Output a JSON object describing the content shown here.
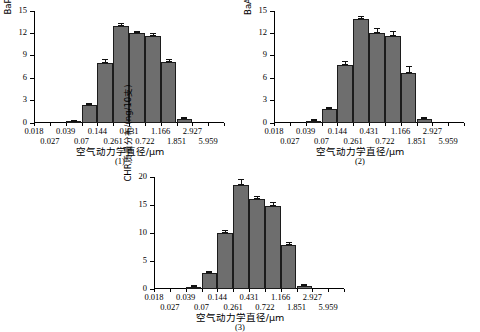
{
  "figure": {
    "background": "#ffffff",
    "bar_color": "#6e6e6e",
    "bar_edge_color": "#1c1c1c",
    "axis_color": "#000000"
  },
  "shared": {
    "xlabel": "空气动力学直径/μm",
    "xtick_labels_row1": [
      "0.018",
      "0.039",
      "0.144",
      "0.431",
      "1.166",
      "2.927"
    ],
    "xtick_labels_row2": [
      "0.027",
      "0.07",
      "0.261",
      "0.722",
      "1.851",
      "5.959"
    ]
  },
  "panels": [
    {
      "tag": "(1)",
      "ylabel": "BaP质量分布/(ng/10支)",
      "chart_data": {
        "type": "bar",
        "title": "",
        "xlabel": "空气动力学直径/μm",
        "ylabel": "BaP质量分布/(ng/10支)",
        "categories": [
          "0.018",
          "0.027",
          "0.039",
          "0.07",
          "0.144",
          "0.261",
          "0.431",
          "0.722",
          "1.166",
          "1.851",
          "2.927",
          "5.959"
        ],
        "values": [
          0,
          0,
          0.15,
          2.35,
          8.1,
          13.0,
          12.0,
          11.6,
          8.2,
          0.5,
          0,
          0
        ],
        "errors": [
          0,
          0,
          0.08,
          0.18,
          0.35,
          0.3,
          0.25,
          0.3,
          0.3,
          0.2,
          0,
          0
        ],
        "ylim": [
          0,
          15
        ],
        "yticks": [
          0,
          3,
          6,
          9,
          12,
          15
        ],
        "ytick_labels": [
          "0",
          "3",
          "6",
          "9",
          "12",
          "15"
        ],
        "grid": false,
        "legend": "none"
      }
    },
    {
      "tag": "(2)",
      "ylabel": "BaA质量分布/(ng/10支)",
      "chart_data": {
        "type": "bar",
        "title": "",
        "xlabel": "空气动力学直径/μm",
        "ylabel": "BaA质量分布/(ng/10支)",
        "categories": [
          "0.018",
          "0.027",
          "0.039",
          "0.07",
          "0.144",
          "0.261",
          "0.431",
          "0.722",
          "1.166",
          "1.851",
          "2.927",
          "5.959"
        ],
        "values": [
          0,
          0,
          0.3,
          1.85,
          7.75,
          13.9,
          12.1,
          11.6,
          6.7,
          0.5,
          0,
          0
        ],
        "errors": [
          0,
          0,
          0.1,
          0.12,
          0.4,
          0.35,
          0.55,
          0.6,
          0.8,
          0.18,
          0,
          0
        ],
        "ylim": [
          0,
          15
        ],
        "yticks": [
          0,
          3,
          6,
          9,
          12,
          15
        ],
        "ytick_labels": [
          "0",
          "3",
          "6",
          "9",
          "12",
          "15"
        ],
        "grid": false,
        "legend": "none"
      }
    },
    {
      "tag": "(3)",
      "ylabel": "CHR质量分布/(ng/10支)",
      "chart_data": {
        "type": "bar",
        "title": "",
        "xlabel": "空气动力学直径/μm",
        "ylabel": "CHR质量分布/(ng/10支)",
        "categories": [
          "0.018",
          "0.027",
          "0.039",
          "0.07",
          "0.144",
          "0.261",
          "0.431",
          "0.722",
          "1.166",
          "1.851",
          "2.927",
          "5.959"
        ],
        "values": [
          0,
          0,
          0.4,
          2.8,
          10.0,
          18.6,
          16.0,
          14.9,
          7.8,
          0.5,
          0,
          0
        ],
        "errors": [
          0,
          0,
          0.12,
          0.25,
          0.35,
          0.8,
          0.5,
          0.45,
          0.5,
          0.18,
          0,
          0
        ],
        "ylim": [
          0,
          20
        ],
        "yticks": [
          0,
          5,
          10,
          15,
          20
        ],
        "ytick_labels": [
          "0",
          "5",
          "10",
          "15",
          "20"
        ],
        "grid": false,
        "legend": "none"
      }
    }
  ]
}
